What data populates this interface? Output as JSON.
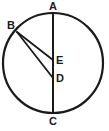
{
  "figure": {
    "kind": "circle-geometry-diagram",
    "background_color": "#ffffff",
    "stroke_color": "#1a1a1a",
    "label_color": "#1a1a1a",
    "circle": {
      "center_x": 53,
      "center_y": 63,
      "radius": 50,
      "stroke_width": 2.2
    },
    "points": [
      {
        "id": "A",
        "label": "A",
        "x": 53,
        "y": 13,
        "label_x": 49,
        "label_y": 1
      },
      {
        "id": "B",
        "label": "B",
        "x": 17,
        "y": 32,
        "label_x": 7,
        "label_y": 20
      },
      {
        "id": "E",
        "label": "E",
        "x": 53,
        "y": 60,
        "label_x": 56,
        "label_y": 55
      },
      {
        "id": "D",
        "label": "D",
        "x": 53,
        "y": 78,
        "label_x": 56,
        "label_y": 73
      },
      {
        "id": "C",
        "label": "C",
        "x": 53,
        "y": 113,
        "label_x": 49,
        "label_y": 116
      }
    ],
    "segments": [
      {
        "id": "AC",
        "from": "A",
        "to": "C",
        "x1": 53,
        "y1": 13,
        "x2": 53,
        "y2": 113,
        "stroke_width": 2.0
      },
      {
        "id": "BE",
        "from": "B",
        "to": "E",
        "x1": 17,
        "y1": 32,
        "x2": 53,
        "y2": 60,
        "stroke_width": 1.8
      },
      {
        "id": "BD",
        "from": "B",
        "to": "D",
        "x1": 17,
        "y1": 32,
        "x2": 53,
        "y2": 78,
        "stroke_width": 1.8
      }
    ]
  }
}
